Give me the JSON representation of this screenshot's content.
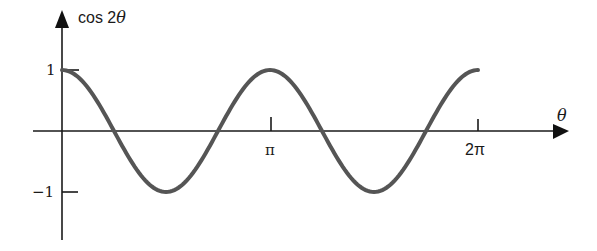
{
  "chart_data": {
    "type": "line",
    "title": "",
    "xlabel": "θ",
    "ylabel": "cos 2θ",
    "ylabel_parts": {
      "func": "cos 2",
      "var": "θ"
    },
    "x_ticks": [
      {
        "value": 3.14159,
        "label": "π"
      },
      {
        "value": 6.28318,
        "label": "2π"
      }
    ],
    "y_ticks": [
      {
        "value": 1,
        "label": "1"
      },
      {
        "value": -1,
        "label": "-1"
      }
    ],
    "xlim": [
      0,
      6.2832
    ],
    "ylim": [
      -1,
      1
    ],
    "grid": false,
    "legend": null,
    "series": [
      {
        "name": "cos 2θ",
        "color": "#555555",
        "x": [
          0,
          0.785,
          1.571,
          2.356,
          3.142,
          3.927,
          4.712,
          5.498,
          6.283
        ],
        "values": [
          1,
          0,
          -1,
          0,
          1,
          0,
          -1,
          0,
          1
        ]
      }
    ]
  },
  "labels": {
    "y_axis": "cos 2θ",
    "x_axis": "θ",
    "tick_pi": "π",
    "tick_2pi": "2π",
    "tick_one": "1",
    "tick_neg_one": "−1"
  }
}
